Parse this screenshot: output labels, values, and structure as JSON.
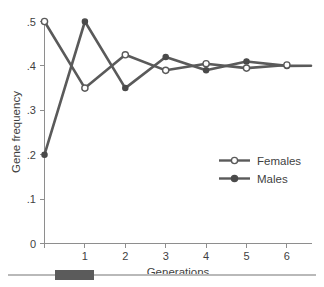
{
  "chart_data": {
    "type": "line",
    "title": "",
    "xlabel": "Generations",
    "ylabel": "Gene frequency",
    "x": [
      0,
      1,
      2,
      3,
      4,
      5,
      6
    ],
    "xlim": [
      -0.15,
      6.45
    ],
    "ylim": [
      0,
      0.52
    ],
    "xticks": [
      0,
      1,
      2,
      3,
      4,
      5,
      6
    ],
    "xtick_labels": [
      "",
      "1",
      "2",
      "3",
      "4",
      "5",
      "6"
    ],
    "yticks": [
      0,
      0.1,
      0.2,
      0.3,
      0.4,
      0.5
    ],
    "ytick_labels": [
      "0",
      ".1",
      ".2",
      ".3",
      ".4",
      ".5"
    ],
    "grid": false,
    "legend_position": "center-right",
    "series": [
      {
        "name": "Females",
        "marker": "open-circle",
        "color": "#5a5a5a",
        "values": [
          0.5,
          0.35,
          0.425,
          0.39,
          0.405,
          0.395,
          0.402
        ]
      },
      {
        "name": "Males",
        "marker": "filled-circle",
        "color": "#4a4a4a",
        "values": [
          0.2,
          0.5,
          0.35,
          0.42,
          0.39,
          0.41,
          0.4
        ]
      }
    ]
  },
  "legend": {
    "entries": [
      {
        "label": "Females",
        "marker": "open-circle"
      },
      {
        "label": "Males",
        "marker": "filled-circle"
      }
    ]
  },
  "axes": {
    "x_title": "Generations",
    "y_title": "Gene frequency"
  },
  "bottom_strip": {
    "name": "scroll-track",
    "thumb_name": "scroll-thumb"
  },
  "colors": {
    "line": "#5a5a5a",
    "marker_fill_open": "#ffffff",
    "marker_fill_closed": "#4a4a4a",
    "axis": "#8e8e8e",
    "text": "#3f3f3f",
    "strip_rule": "#b9b9b9",
    "strip_thumb": "#5b5b5b"
  }
}
